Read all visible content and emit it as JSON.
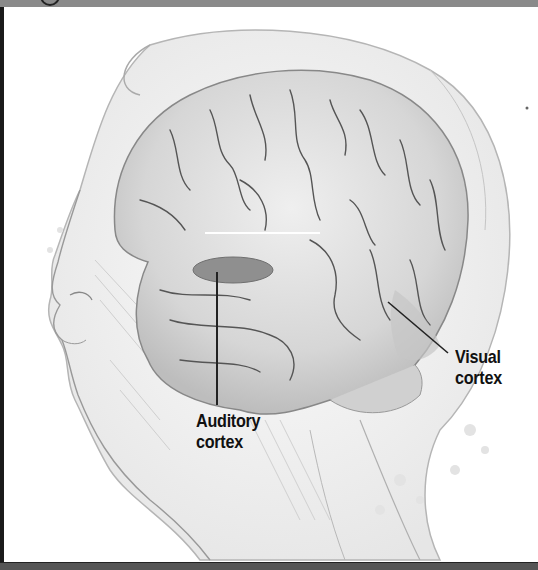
{
  "diagram": {
    "labels": [
      {
        "id": "auditory",
        "line1": "Auditory",
        "line2": "cortex"
      },
      {
        "id": "visual",
        "line1": "Visual",
        "line2": "cortex"
      }
    ],
    "colors": {
      "top_bar": "#8a8a8a",
      "frame_border": "#1a1a1a",
      "brain_fill": "#d9d9d9",
      "auditory_region": "#8f8f8f",
      "label_text": "#111111",
      "leader_line": "#222222"
    }
  }
}
